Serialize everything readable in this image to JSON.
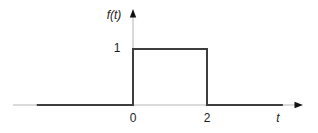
{
  "figure": {
    "background": "#ffffff",
    "axis_color": "#b5b5b5",
    "trace_color": "#3d3d3d",
    "arrow_color": "#111111",
    "labels": {
      "y_axis": "f(t)",
      "x_axis": "t",
      "y_tick_1": "1",
      "x_tick_0": "0",
      "x_tick_2": "2"
    }
  },
  "chart_data": {
    "type": "line",
    "title": "",
    "xlabel": "t",
    "ylabel": "f(t)",
    "x_ticks": [
      0,
      2
    ],
    "y_ticks": [
      1
    ],
    "xlim": [
      -3.2,
      4.6
    ],
    "ylim": [
      0,
      1.7
    ],
    "grid": false,
    "legend": false,
    "series": [
      {
        "name": "rectangular pulse f(t)=1 for 0<=t<=2 else 0",
        "x": [
          -2.6,
          0,
          0,
          2,
          2,
          4.05
        ],
        "y": [
          0,
          0,
          1,
          1,
          0,
          0
        ]
      }
    ]
  }
}
